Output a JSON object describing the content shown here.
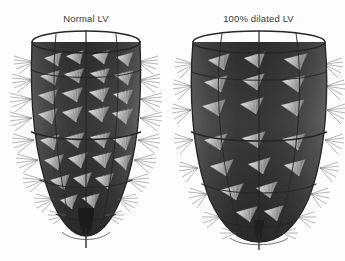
{
  "figure": {
    "background_color": "#fdfdfd",
    "label_color": "#3b3b3b",
    "panel_count": 2
  },
  "panels": [
    {
      "id": "normal-lv",
      "label": "Normal LV",
      "shape": "elongated bullet / conical ventricle with pointed apex",
      "apex_style": "pointed with dark apical bulb and short axial stalk",
      "wireframe": {
        "meridian_lines": 5,
        "latitude_rings": 4,
        "ring_y_fractions": [
          0.035,
          0.33,
          0.58,
          0.82
        ],
        "line_color": "#2a2a2a"
      },
      "surface": {
        "fill_dark": "#3a3a3a",
        "fill_mid": "#4c4c4c",
        "fill_light": "#606060",
        "highlight": "#7a7a7a"
      },
      "fiber_fans": {
        "description": "triangular radiating fiber bundles",
        "rows": 8,
        "per_row": 7,
        "color_light": "#d8d8d8",
        "color_mid": "#9a9a9a",
        "color_dark": "#2e2e2e",
        "density": "high"
      },
      "geometry": {
        "top_rim_cx": 86,
        "top_rim_cy": 14,
        "top_rim_rx": 54,
        "top_rim_ry": 11,
        "body_half_width": 62,
        "apex_y": 205
      }
    },
    {
      "id": "dilated-lv",
      "label": "100% dilated LV",
      "shape": "wide rounded spheroidal ventricle with blunt apex",
      "apex_style": "broad rounded apex with short central stalk",
      "wireframe": {
        "meridian_lines": 5,
        "latitude_rings": 4,
        "ring_y_fractions": [
          0.035,
          0.33,
          0.58,
          0.82
        ],
        "line_color": "#2a2a2a"
      },
      "surface": {
        "fill_dark": "#3a3a3a",
        "fill_mid": "#4c4c4c",
        "fill_light": "#606060",
        "highlight": "#7a7a7a"
      },
      "fiber_fans": {
        "description": "triangular radiating fiber bundles, sparser and larger",
        "rows": 7,
        "per_row": 6,
        "color_light": "#d8d8d8",
        "color_mid": "#9a9a9a",
        "color_dark": "#2e2e2e",
        "density": "moderate"
      },
      "geometry": {
        "top_rim_cx": 87,
        "top_rim_cy": 14,
        "top_rim_rx": 66,
        "top_rim_ry": 11,
        "body_half_width": 75,
        "apex_y": 212
      }
    }
  ]
}
